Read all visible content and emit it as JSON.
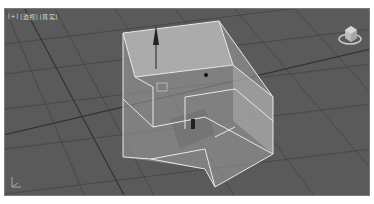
{
  "viewport": {
    "labels": [
      "[+]",
      "[透视]",
      "[真实]"
    ],
    "background": "#5a5a5a",
    "grid_color": "#3e3e3e",
    "selection_color": "#e8e8e8",
    "object_fill": "#b8b8b8"
  },
  "viewcube": {
    "icon": "viewcube-icon"
  },
  "axis_tripod": {
    "icon": "axis-tripod-icon"
  },
  "gizmo": {
    "icon": "move-gizmo-icon"
  }
}
